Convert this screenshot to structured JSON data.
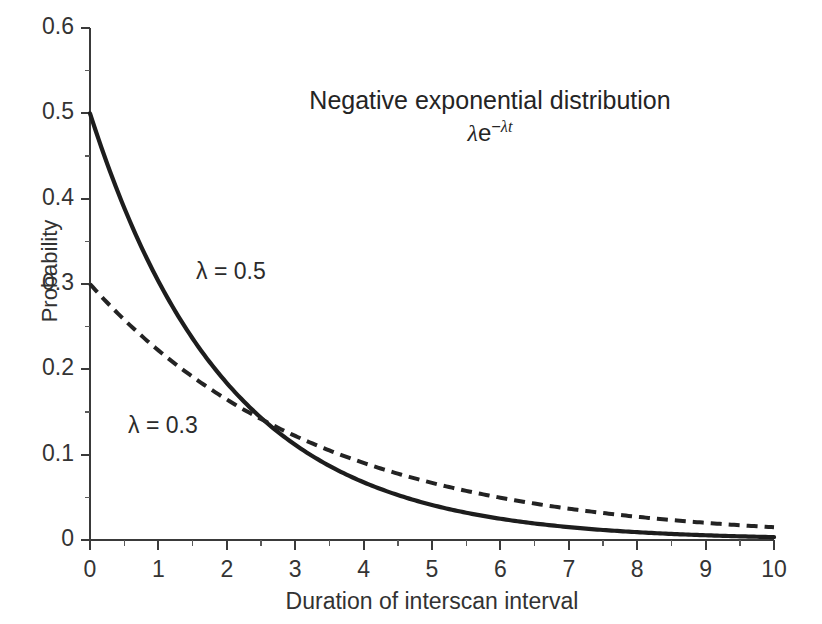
{
  "chart_data": {
    "type": "line",
    "title": "Negative exponential distribution",
    "formula_lambda": "λ",
    "formula_base": "e",
    "formula_exponent_minus": "−",
    "formula_exponent_lambda": "λ",
    "formula_exponent_t": "t",
    "formula_plain": "λe−λt",
    "xlabel": "Duration of interscan interval",
    "ylabel": "Probability",
    "xlim": [
      0,
      10
    ],
    "ylim": [
      0,
      0.6
    ],
    "grid": false,
    "legend_position": "inline-annotation",
    "x_ticks": [
      "0",
      "1",
      "2",
      "3",
      "4",
      "5",
      "6",
      "7",
      "8",
      "9",
      "10"
    ],
    "x_tick_values": [
      0,
      1,
      2,
      3,
      4,
      5,
      6,
      7,
      8,
      9,
      10
    ],
    "x_minor_tick_values": [
      0.5,
      1.5,
      2.5,
      3.5,
      4.5,
      5.5,
      6.5,
      7.5,
      8.5,
      9.5
    ],
    "y_ticks": [
      "0",
      "0.1",
      "0.2",
      "0.3",
      "0.4",
      "0.5",
      "0.6"
    ],
    "y_tick_values": [
      0,
      0.1,
      0.2,
      0.3,
      0.4,
      0.5,
      0.6
    ],
    "y_minor_tick_values": [
      0.05,
      0.15,
      0.25,
      0.35,
      0.45,
      0.55
    ],
    "series": [
      {
        "name": "λ = 0.5",
        "lambda": 0.5,
        "style": "solid",
        "color": "#1d1d1d",
        "annotation": "λ = 0.5",
        "x": [
          0,
          0.5,
          1,
          1.5,
          2,
          2.5,
          3,
          3.5,
          4,
          4.5,
          5,
          5.5,
          6,
          6.5,
          7,
          7.5,
          8,
          8.5,
          9,
          9.5,
          10
        ],
        "values": [
          0.5,
          0.389,
          0.303,
          0.236,
          0.184,
          0.143,
          0.112,
          0.087,
          0.068,
          0.053,
          0.041,
          0.032,
          0.025,
          0.019,
          0.015,
          0.012,
          0.009,
          0.007,
          0.006,
          0.004,
          0.003
        ]
      },
      {
        "name": "λ = 0.3",
        "lambda": 0.3,
        "style": "dashed",
        "color": "#232323",
        "annotation": "λ = 0.3",
        "x": [
          0,
          0.5,
          1,
          1.5,
          2,
          2.5,
          3,
          3.5,
          4,
          4.5,
          5,
          5.5,
          6,
          6.5,
          7,
          7.5,
          8,
          8.5,
          9,
          9.5,
          10
        ],
        "values": [
          0.3,
          0.258,
          0.222,
          0.191,
          0.165,
          0.142,
          0.122,
          0.105,
          0.09,
          0.078,
          0.067,
          0.058,
          0.05,
          0.043,
          0.037,
          0.032,
          0.027,
          0.023,
          0.02,
          0.017,
          0.015
        ]
      }
    ],
    "crossing_point": {
      "x": 2.55,
      "y": 0.14
    }
  }
}
